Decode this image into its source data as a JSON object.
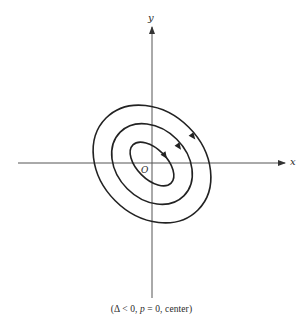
{
  "diagram": {
    "type": "phase-portrait",
    "axes": {
      "x_label": "x",
      "y_label": "y",
      "origin_label": "O"
    },
    "trajectories": {
      "count": 3,
      "shape": "concentric tilted ellipses",
      "direction": "clockwise"
    },
    "caption": {
      "open": "(",
      "delta_part": "Δ < 0, ",
      "p_symbol": "p",
      "p_part": " = 0, ",
      "type_part": "center",
      "close": ")"
    },
    "colors": {
      "ink": "#222222",
      "axis": "#555555",
      "background": "#ffffff"
    }
  }
}
